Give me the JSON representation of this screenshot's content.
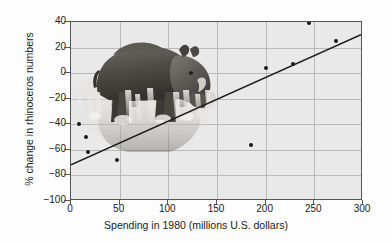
{
  "chart_data": {
    "type": "scatter",
    "title": "",
    "xlabel": "Spending in 1980 (millions U.S. dollars)",
    "ylabel": "% change in rhinoceros numbers",
    "xlim": [
      0,
      300
    ],
    "ylim": [
      -100,
      40
    ],
    "xticks": [
      0,
      50,
      100,
      150,
      200,
      250,
      300
    ],
    "yticks": [
      -100,
      -80,
      -60,
      -40,
      -20,
      0,
      20,
      40
    ],
    "xtick_labels": [
      "0",
      "50",
      "100",
      "150",
      "200",
      "250",
      "300"
    ],
    "ytick_labels": [
      "-100",
      "-80",
      "-60",
      "-40",
      "-20",
      "0",
      "20",
      "40"
    ],
    "grid": true,
    "legend": "none",
    "points": [
      {
        "x": 8,
        "y": -40
      },
      {
        "x": 15,
        "y": -50
      },
      {
        "x": 17,
        "y": -62
      },
      {
        "x": 47,
        "y": -68
      },
      {
        "x": 185,
        "y": -56
      },
      {
        "x": 200,
        "y": 4
      },
      {
        "x": 228,
        "y": 7
      },
      {
        "x": 245,
        "y": 39
      },
      {
        "x": 272,
        "y": 25
      }
    ],
    "trend_line": {
      "x_start": 0,
      "y_start": -73,
      "x_end": 300,
      "y_end": 30
    },
    "colors": {
      "plot_background": "#e9e9e9",
      "grid": "#b9b9b9",
      "axis": "#555555",
      "marker": "#1b1b1b",
      "trend_line": "#1b1b1b",
      "text": "#1a1a1a"
    },
    "inset_image": {
      "name": "rhinoceros-photo",
      "description": "black rhinoceros standing in water with reflection"
    }
  }
}
